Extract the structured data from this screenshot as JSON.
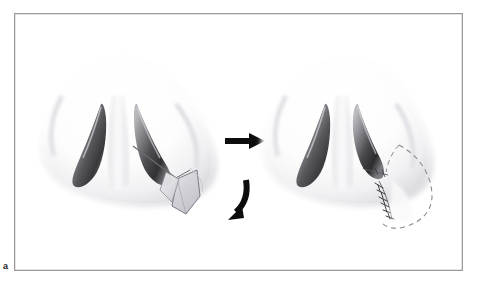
{
  "figure": {
    "panel_letter": "a",
    "caption": "",
    "title": "",
    "frame_color": "#9a9a9e",
    "background_color": "#ffffff"
  },
  "illustration": {
    "type": "surgical-diagram",
    "subject": "nose-basal-view",
    "procedure": "alar base / nostril sill wedge excision",
    "panels": [
      {
        "id": "pre-operative",
        "name": "nose-preoperative",
        "label": "",
        "description": "Basal view of nose with planned wedge excision marked on right alar base",
        "features": [
          "left-nostril",
          "right-nostril",
          "columella",
          "nasal-tip",
          "incision-line",
          "excision-wedge-flap"
        ]
      },
      {
        "id": "post-operative",
        "name": "nose-postoperative",
        "label": "",
        "description": "Basal view of nose after closure with sutures and dashed original contour",
        "features": [
          "left-nostril",
          "right-nostril",
          "columella",
          "nasal-tip",
          "suture-line",
          "original-contour-dashed"
        ]
      }
    ],
    "arrows": [
      {
        "name": "straight-arrow",
        "direction": "right",
        "style": "solid-black"
      },
      {
        "name": "curved-arrow",
        "direction": "down-left",
        "style": "solid-black-curved"
      }
    ],
    "colors": {
      "skin_light": "#ffffff",
      "skin_shadow": "#e8e8ea",
      "nostril_dark": "#3a3a3c",
      "nostril_mid": "#8e8e92",
      "flap_fill": "#cfcfd4",
      "line_stroke": "#6e6e73",
      "arrow_fill": "#0d0d0d",
      "dashed_stroke": "#8a8a90",
      "suture_stroke": "#2a2a2c"
    }
  }
}
